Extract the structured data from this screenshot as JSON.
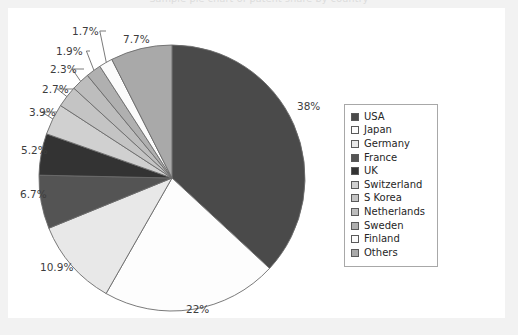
{
  "title": "Sample pie chart of patent share by country",
  "chart_data": {
    "type": "pie",
    "title": "Sample pie chart of patent share by country",
    "xlabel": "",
    "ylabel": "",
    "legend_position": "right",
    "grid": false,
    "categories": [
      "USA",
      "Japan",
      "Germany",
      "France",
      "UK",
      "Switzerland",
      "S Korea",
      "Netherlands",
      "Sweden",
      "Finland",
      "Others"
    ],
    "values": [
      38,
      22,
      10.9,
      6.7,
      5.2,
      3.9,
      2.7,
      2.3,
      1.9,
      1.7,
      7.7
    ],
    "labels": [
      "38%",
      "22%",
      "10.9%",
      "6.7%",
      "5.2%",
      "3.9%",
      "2.7%",
      "2.3%",
      "1.9%",
      "1.7%",
      "7.7%"
    ],
    "colors": [
      "#4a4a4a",
      "#fdfdfd",
      "#e8e8e8",
      "#545454",
      "#333333",
      "#d0d0d0",
      "#c4c4c4",
      "#bdbdbd",
      "#b0b0b0",
      "#fbfbfb",
      "#a9a9a9"
    ],
    "slices": [
      {
        "name": "USA",
        "value": 38,
        "label": "38%",
        "color": "#4a4a4a"
      },
      {
        "name": "Japan",
        "value": 22,
        "label": "22%",
        "color": "#fdfdfd"
      },
      {
        "name": "Germany",
        "value": 10.9,
        "label": "10.9%",
        "color": "#e8e8e8"
      },
      {
        "name": "France",
        "value": 6.7,
        "label": "6.7%",
        "color": "#545454"
      },
      {
        "name": "UK",
        "value": 5.2,
        "label": "5.2%",
        "color": "#333333"
      },
      {
        "name": "Switzerland",
        "value": 3.9,
        "label": "3.9%",
        "color": "#d0d0d0"
      },
      {
        "name": "S Korea",
        "value": 2.7,
        "label": "2.7%",
        "color": "#c4c4c4"
      },
      {
        "name": "Netherlands",
        "value": 2.3,
        "label": "2.3%",
        "color": "#bdbdbd"
      },
      {
        "name": "Sweden",
        "value": 1.9,
        "label": "1.9%",
        "color": "#b0b0b0"
      },
      {
        "name": "Finland",
        "value": 1.7,
        "label": "1.7%",
        "color": "#fbfbfb"
      },
      {
        "name": "Others",
        "value": 7.7,
        "label": "7.7%",
        "color": "#a9a9a9"
      }
    ]
  },
  "legend": {
    "items": [
      {
        "label": "USA",
        "color": "#4a4a4a"
      },
      {
        "label": "Japan",
        "color": "#fdfdfd"
      },
      {
        "label": "Germany",
        "color": "#e8e8e8"
      },
      {
        "label": "France",
        "color": "#545454"
      },
      {
        "label": "UK",
        "color": "#333333"
      },
      {
        "label": "Switzerland",
        "color": "#d0d0d0"
      },
      {
        "label": "S Korea",
        "color": "#c4c4c4"
      },
      {
        "label": "Netherlands",
        "color": "#bdbdbd"
      },
      {
        "label": "Sweden",
        "color": "#b0b0b0"
      },
      {
        "label": "Finland",
        "color": "#fbfbfb"
      },
      {
        "label": "Others",
        "color": "#a9a9a9"
      }
    ]
  },
  "pie_geometry": {
    "cx": 172,
    "cy": 178,
    "r": 133,
    "start_angle_deg": -90
  },
  "label_positions": [
    {
      "key": "38%",
      "x": 297,
      "y": 100,
      "leader": false
    },
    {
      "key": "22%",
      "x": 186,
      "y": 303,
      "leader": false
    },
    {
      "key": "10.9%",
      "x": 40,
      "y": 261,
      "leader": false
    },
    {
      "key": "6.7%",
      "x": 20,
      "y": 188,
      "leader": false
    },
    {
      "key": "5.2%",
      "x": 21,
      "y": 144,
      "leader": false
    },
    {
      "key": "3.9%",
      "x": 29,
      "y": 106,
      "leader": true
    },
    {
      "key": "2.7%",
      "x": 42,
      "y": 83,
      "leader": true
    },
    {
      "key": "2.3%",
      "x": 50,
      "y": 63,
      "leader": true
    },
    {
      "key": "1.9%",
      "x": 56,
      "y": 45,
      "leader": true
    },
    {
      "key": "1.7%",
      "x": 72,
      "y": 25,
      "leader": true
    },
    {
      "key": "7.7%",
      "x": 123,
      "y": 33,
      "leader": false
    }
  ]
}
